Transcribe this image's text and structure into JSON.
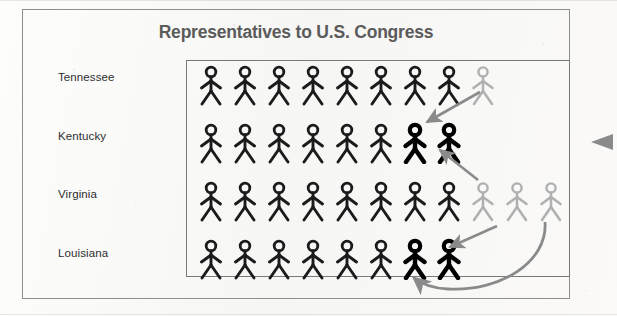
{
  "chart_data": {
    "type": "bar",
    "subtype": "pictograph",
    "title": "Representatives to U.S. Congress",
    "xlabel": "",
    "ylabel": "",
    "unit_label": "1 figure = 1 representative",
    "categories": [
      "Tennessee",
      "Kentucky",
      "Virginia",
      "Louisiana"
    ],
    "values": [
      9,
      8,
      11,
      8
    ],
    "series": [
      {
        "name": "Representatives",
        "values": [
          9,
          8,
          11,
          8
        ]
      }
    ],
    "rows": [
      {
        "label": "Tennessee",
        "total": 9,
        "dark_count": 8,
        "light_count": 1,
        "bold_count": 0,
        "icons": [
          "dark",
          "dark",
          "dark",
          "dark",
          "dark",
          "dark",
          "dark",
          "dark",
          "light"
        ]
      },
      {
        "label": "Kentucky",
        "total": 8,
        "dark_count": 6,
        "light_count": 0,
        "bold_count": 2,
        "icons": [
          "dark",
          "dark",
          "dark",
          "dark",
          "dark",
          "dark",
          "bold",
          "bold"
        ]
      },
      {
        "label": "Virginia",
        "total": 11,
        "dark_count": 8,
        "light_count": 3,
        "bold_count": 0,
        "icons": [
          "dark",
          "dark",
          "dark",
          "dark",
          "dark",
          "dark",
          "dark",
          "dark",
          "light",
          "light",
          "light"
        ]
      },
      {
        "label": "Louisiana",
        "total": 8,
        "dark_count": 6,
        "light_count": 0,
        "bold_count": 2,
        "icons": [
          "dark",
          "dark",
          "dark",
          "dark",
          "dark",
          "dark",
          "bold",
          "bold"
        ]
      }
    ],
    "grid": false,
    "legend_position": "none",
    "annotations": [
      {
        "name": "arrow-tennessee-to-kentucky",
        "from": "Tennessee light figure",
        "to": "Kentucky bold figures",
        "style": "straight"
      },
      {
        "name": "arrow-virginia-to-kentucky",
        "from": "Virginia light figures",
        "to": "Kentucky bold figures",
        "style": "straight"
      },
      {
        "name": "arrow-virginia-to-louisiana",
        "from": "Virginia light figures",
        "to": "Louisiana bold figures",
        "style": "straight"
      },
      {
        "name": "arrow-virginia-curved-to-louisiana",
        "from": "Virginia far-right light figure",
        "to": "Louisiana bold figures",
        "style": "curved"
      },
      {
        "name": "side-pointer",
        "from": "right margin",
        "to": "chart",
        "style": "arrowhead"
      }
    ]
  },
  "colors": {
    "figure_dark": "#1b1b1b",
    "figure_bold": "#000000",
    "figure_light": "#b0b0b0",
    "title": "#5b5b5b",
    "label": "#2e2e2e",
    "arrow": "#878787",
    "outer_frame": "#8e8e8e",
    "plot_frame": "#787878",
    "background": "#fbfbfa"
  },
  "labels": {
    "row_0": "Tennessee",
    "row_1": "Kentucky",
    "row_2": "Virginia",
    "row_3": "Louisiana"
  }
}
